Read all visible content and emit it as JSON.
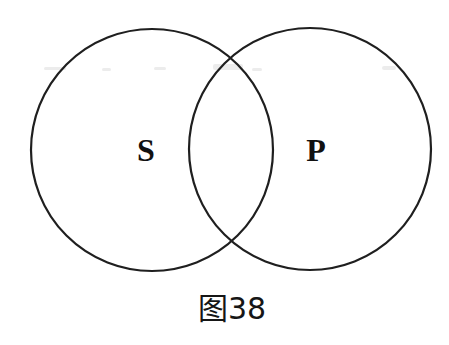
{
  "diagram": {
    "type": "venn",
    "circles": [
      {
        "label": "S"
      },
      {
        "label": "P"
      }
    ],
    "caption": "图38"
  },
  "colors": {
    "background": "#ffffff",
    "stroke": "#1f1f1f",
    "text": "#111111"
  }
}
